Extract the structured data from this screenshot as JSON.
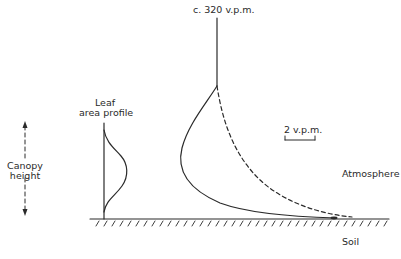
{
  "labels": {
    "top_concentration": "c. 320 v.p.m.",
    "leaf_title_line1": "Leaf",
    "leaf_title_line2": "area profile",
    "canopy_line1": "Canopy",
    "canopy_line2": "height",
    "scale_bar": "2 v.p.m.",
    "atmosphere": "Atmosphere",
    "soil": "Soil"
  },
  "colors": {
    "ink": "#2a2a2a",
    "background": "#ffffff"
  },
  "elements": {
    "curves": [
      {
        "name": "leaf-area-profile",
        "style": "solid"
      },
      {
        "name": "co2-profile-daytime",
        "style": "solid"
      },
      {
        "name": "co2-profile-night",
        "style": "dashed"
      }
    ],
    "ground": {
      "name": "soil-surface",
      "style": "hatched"
    },
    "arrows": [
      {
        "name": "canopy-height-arrow",
        "style": "dashed-double-headed"
      }
    ]
  }
}
